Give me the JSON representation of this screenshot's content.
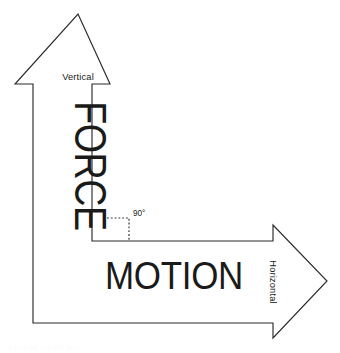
{
  "diagram": {
    "type": "bent-arrow-vector-diagram",
    "background_color": "#ffffff",
    "stroke_color": "#2b2b2b",
    "fill_color": "#ffffff",
    "text_color": "#1a1a1a",
    "labels": {
      "vertical": "Vertical",
      "force": "FORCE",
      "angle": "90°",
      "motion": "MOTION",
      "horizontal": "Horizontal"
    },
    "footer_clipped_text": "a line of cut-off text"
  }
}
